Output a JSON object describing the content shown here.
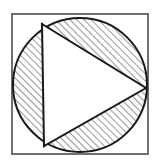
{
  "figure": {
    "title": "Circle inscribed in square with inscribed triangle, hatched segments",
    "canvas": {
      "width": 161,
      "height": 168,
      "background": "#ffffff"
    },
    "colors": {
      "stroke": "#1a1a1a",
      "square_stroke": "#4d4d4d",
      "hatch": "#333333",
      "fill_white": "#ffffff"
    },
    "square": {
      "name": "outer-square",
      "x": 12,
      "y": 14,
      "width": 136,
      "height": 140,
      "stroke_width": 1.6,
      "fill": "none"
    },
    "circle": {
      "name": "inscribed-circle",
      "cx": 80,
      "cy": 85,
      "r": 67,
      "stroke_width": 2.0,
      "fill": "none"
    },
    "triangle": {
      "name": "inscribed-triangle",
      "points": [
        {
          "label": "A",
          "x": 42,
          "y": 24
        },
        {
          "label": "B",
          "x": 146,
          "y": 88
        },
        {
          "label": "C",
          "x": 44,
          "y": 146
        }
      ],
      "points_attr": "42,24 146,88 44,146",
      "stroke_width": 2.0,
      "fill": "#ffffff"
    },
    "hatching": {
      "name": "diagonal-hatch",
      "angle_degrees": 45,
      "direction": "bottom-left-to-top-right",
      "spacing_px": 5,
      "line_width": 1.0,
      "region": "between circle and triangle"
    },
    "chords": [
      {
        "name": "chord-top",
        "x1": 42,
        "y1": 24,
        "x2": 146,
        "y2": 88
      },
      {
        "name": "chord-bottom",
        "x1": 44,
        "y1": 146,
        "x2": 146,
        "y2": 88
      },
      {
        "name": "chord-left",
        "x1": 42,
        "y1": 24,
        "x2": 44,
        "y2": 146
      }
    ]
  }
}
